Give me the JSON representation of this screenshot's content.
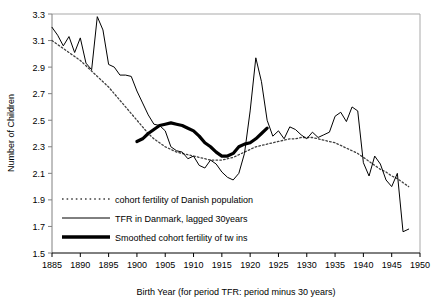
{
  "chart_data": {
    "type": "line",
    "title": "",
    "xlabel": "Birth Year (for period TFR: period minus 30 years)",
    "ylabel": "Number of Children",
    "xlim": [
      1885,
      1950
    ],
    "ylim": [
      1.5,
      3.3
    ],
    "xticks": [
      1885,
      1890,
      1895,
      1900,
      1905,
      1910,
      1915,
      1920,
      1925,
      1930,
      1935,
      1940,
      1945,
      1950
    ],
    "yticks": [
      1.5,
      1.7,
      1.9,
      2.1,
      2.3,
      2.5,
      2.7,
      2.9,
      3.1,
      3.3
    ],
    "grid": false,
    "legend_position": "inside-lower-left",
    "series": [
      {
        "name": "cohort fertility of Danish population",
        "style": "dotted",
        "color": "#404040",
        "x": [
          1885,
          1886,
          1887,
          1888,
          1889,
          1890,
          1891,
          1892,
          1893,
          1894,
          1895,
          1896,
          1897,
          1898,
          1899,
          1900,
          1901,
          1902,
          1903,
          1904,
          1905,
          1906,
          1907,
          1908,
          1909,
          1910,
          1911,
          1912,
          1913,
          1914,
          1915,
          1916,
          1917,
          1918,
          1919,
          1920,
          1921,
          1922,
          1923,
          1924,
          1925,
          1926,
          1927,
          1928,
          1929,
          1930,
          1931,
          1932,
          1933,
          1934,
          1935,
          1936,
          1937,
          1938,
          1939,
          1940,
          1941,
          1942,
          1943,
          1944,
          1945,
          1946,
          1947,
          1948
        ],
        "values": [
          3.1,
          3.07,
          3.04,
          3.01,
          2.98,
          2.95,
          2.91,
          2.87,
          2.83,
          2.79,
          2.75,
          2.7,
          2.65,
          2.6,
          2.55,
          2.5,
          2.45,
          2.4,
          2.36,
          2.33,
          2.3,
          2.28,
          2.26,
          2.25,
          2.24,
          2.23,
          2.22,
          2.21,
          2.2,
          2.2,
          2.2,
          2.21,
          2.22,
          2.24,
          2.26,
          2.28,
          2.3,
          2.31,
          2.32,
          2.33,
          2.34,
          2.35,
          2.36,
          2.36,
          2.37,
          2.37,
          2.37,
          2.36,
          2.35,
          2.34,
          2.33,
          2.31,
          2.29,
          2.27,
          2.25,
          2.22,
          2.19,
          2.16,
          2.13,
          2.11,
          2.08,
          2.06,
          2.03,
          2.0
        ]
      },
      {
        "name": "TFR in Danmark, lagged 30years",
        "style": "solid-thin",
        "color": "#000000",
        "x": [
          1885,
          1886,
          1887,
          1888,
          1889,
          1890,
          1891,
          1892,
          1893,
          1894,
          1895,
          1896,
          1897,
          1898,
          1899,
          1900,
          1901,
          1902,
          1903,
          1904,
          1905,
          1906,
          1907,
          1908,
          1909,
          1910,
          1911,
          1912,
          1913,
          1914,
          1915,
          1916,
          1917,
          1918,
          1919,
          1920,
          1921,
          1922,
          1923,
          1924,
          1925,
          1926,
          1927,
          1928,
          1929,
          1930,
          1931,
          1932,
          1933,
          1934,
          1935,
          1936,
          1937,
          1938,
          1939,
          1940,
          1941,
          1942,
          1943,
          1944,
          1945,
          1946,
          1947,
          1948
        ],
        "values": [
          3.2,
          3.14,
          3.06,
          3.13,
          3.01,
          3.12,
          2.93,
          2.88,
          3.28,
          3.18,
          2.92,
          2.9,
          2.84,
          2.84,
          2.83,
          2.72,
          2.63,
          2.54,
          2.47,
          2.46,
          2.42,
          2.3,
          2.27,
          2.26,
          2.21,
          2.23,
          2.16,
          2.14,
          2.2,
          2.17,
          2.11,
          2.07,
          2.05,
          2.1,
          2.25,
          2.57,
          2.97,
          2.79,
          2.5,
          2.38,
          2.42,
          2.36,
          2.45,
          2.43,
          2.39,
          2.36,
          2.41,
          2.37,
          2.39,
          2.41,
          2.53,
          2.56,
          2.49,
          2.6,
          2.57,
          2.18,
          2.08,
          2.23,
          2.17,
          2.05,
          2.0,
          2.1,
          1.66,
          1.68
        ]
      },
      {
        "name": "Smoothed cohort fertility of tw ins",
        "style": "solid-thick",
        "color": "#000000",
        "x": [
          1900,
          1901,
          1902,
          1903,
          1904,
          1905,
          1906,
          1907,
          1908,
          1909,
          1910,
          1911,
          1912,
          1913,
          1914,
          1915,
          1916,
          1917,
          1918,
          1919,
          1920,
          1921,
          1922,
          1923
        ],
        "values": [
          2.34,
          2.36,
          2.4,
          2.43,
          2.46,
          2.47,
          2.48,
          2.47,
          2.46,
          2.44,
          2.42,
          2.38,
          2.33,
          2.3,
          2.26,
          2.23,
          2.23,
          2.25,
          2.3,
          2.32,
          2.33,
          2.36,
          2.4,
          2.44
        ]
      }
    ]
  },
  "legend": {
    "items": [
      {
        "label": "cohort fertility of Danish population",
        "marker": "dotted-line-swatch"
      },
      {
        "label": "TFR in Danmark, lagged 30years",
        "marker": "thin-line-swatch"
      },
      {
        "label": "Smoothed cohort fertility of tw ins",
        "marker": "thick-line-swatch"
      }
    ]
  }
}
